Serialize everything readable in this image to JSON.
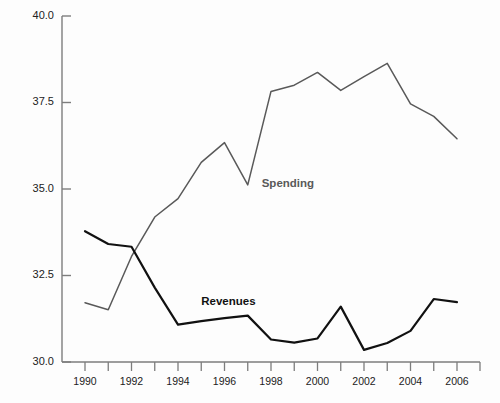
{
  "chart_data": {
    "type": "line",
    "title": "",
    "xlabel": "",
    "ylabel": "Percent",
    "xlim": [
      1989.6,
      2006.9
    ],
    "ylim": [
      30.0,
      40.0
    ],
    "grid": false,
    "legend_position": "inline-annotation",
    "x": [
      1990,
      1991,
      1992,
      1993,
      1994,
      1995,
      1996,
      1997,
      1998,
      1999,
      2000,
      2001,
      2002,
      2003,
      2004,
      2005,
      2006
    ],
    "y_ticks": [
      30.0,
      32.5,
      35.0,
      37.5,
      40.0
    ],
    "y_tick_labels": [
      "30.0",
      "32.5",
      "35.0",
      "37.5",
      "40.0"
    ],
    "x_ticks": [
      1990,
      1991,
      1992,
      1993,
      1994,
      1995,
      1996,
      1997,
      1998,
      1999,
      2000,
      2001,
      2002,
      2003,
      2004,
      2005,
      2006
    ],
    "x_tick_labels": [
      "1990",
      "",
      "1992",
      "",
      "1994",
      "",
      "1996",
      "",
      "1998",
      "",
      "2000",
      "",
      "2002",
      "",
      "2004",
      "",
      "2006"
    ],
    "series": [
      {
        "name": "Spending",
        "color": "#595959",
        "width": 1.5,
        "label_x": 1997.6,
        "label_y": 35.15,
        "values": [
          31.71,
          31.51,
          33.05,
          34.19,
          34.72,
          35.77,
          36.34,
          35.12,
          37.82,
          38.0,
          38.37,
          37.85,
          38.25,
          38.63,
          37.46,
          37.1,
          36.45
        ]
      },
      {
        "name": "Revenues",
        "color": "#111111",
        "width": 2.2,
        "label_x": 1995.0,
        "label_y": 31.72,
        "values": [
          33.78,
          33.41,
          33.33,
          32.15,
          31.08,
          31.18,
          31.27,
          31.34,
          30.65,
          30.56,
          30.68,
          31.6,
          30.35,
          30.55,
          30.9,
          31.82,
          31.73
        ]
      }
    ]
  },
  "axes": {
    "y_axis_line_color": "#7d7d7d",
    "x_axis_line_color": "#7d7d7d"
  }
}
